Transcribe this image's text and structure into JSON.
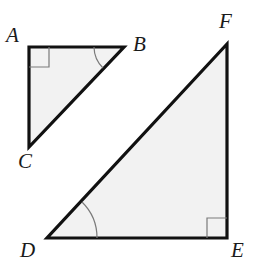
{
  "figure": {
    "kind": "geometry-diagram",
    "canvas": {
      "width": 253,
      "height": 266
    },
    "style": {
      "fill": "#f2f2f2",
      "stroke": "#111111",
      "stroke_width": 3.2,
      "mark_stroke": "#7a7a7a",
      "mark_stroke_width": 1.2,
      "background": "#ffffff",
      "label_color": "#1a1a1a"
    },
    "triangles": [
      {
        "name": "triangle-abc",
        "vertices": [
          {
            "label": "A",
            "x": 29,
            "y": 47
          },
          {
            "label": "B",
            "x": 124,
            "y": 47
          },
          {
            "label": "C",
            "x": 29,
            "y": 147
          }
        ],
        "points": "29,47 124,47 29,147",
        "right_angle_at": "A",
        "arc_angle_at": "B"
      },
      {
        "name": "triangle-def",
        "vertices": [
          {
            "label": "D",
            "x": 47,
            "y": 238
          },
          {
            "label": "E",
            "x": 227,
            "y": 238
          },
          {
            "label": "F",
            "x": 227,
            "y": 44
          }
        ],
        "points": "47,238 227,238 227,44",
        "right_angle_at": "E",
        "arc_angle_at": "D"
      }
    ],
    "labels": [
      {
        "id": "label-a",
        "text": "A",
        "left": 6,
        "top": 25
      },
      {
        "id": "label-b",
        "text": "B",
        "left": 133,
        "top": 34
      },
      {
        "id": "label-c",
        "text": "C",
        "left": 18,
        "top": 151
      },
      {
        "id": "label-d",
        "text": "D",
        "left": 20,
        "top": 240
      },
      {
        "id": "label-e",
        "text": "E",
        "left": 231,
        "top": 240
      },
      {
        "id": "label-f",
        "text": "F",
        "left": 219,
        "top": 11
      }
    ],
    "right_angle_marks": [
      {
        "id": "right-angle-mark-a",
        "path": "M 29 67 L 49 67 L 49 47"
      },
      {
        "id": "right-angle-mark-e",
        "path": "M 207 238 L 207 218 L 227 218"
      }
    ],
    "angle_arcs": [
      {
        "id": "angle-arc-b",
        "path": "M 94 47 A 30 30 0 0 0 103 68"
      },
      {
        "id": "angle-arc-d",
        "path": "M 97 238 A 50 50 0 0 0 82 202"
      }
    ]
  }
}
